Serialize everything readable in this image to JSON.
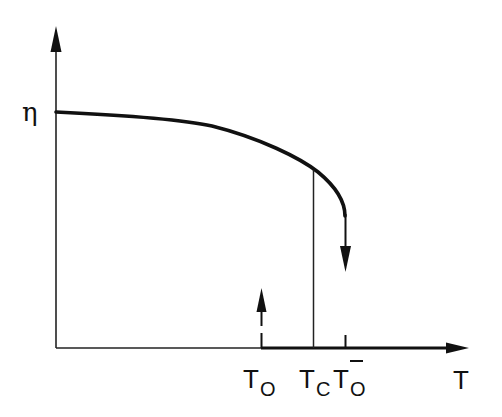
{
  "diagram": {
    "type": "order-parameter-vs-temperature",
    "y_axis": {
      "label": "η"
    },
    "x_axis": {
      "label": "T"
    },
    "markers": [
      {
        "id": "T0",
        "main": "T",
        "sub": "O",
        "overbar": false,
        "description": "upward dashed arrow from axis (supercooling limit)"
      },
      {
        "id": "Tc",
        "main": "T",
        "sub": "C",
        "overbar": false,
        "description": "vertical line from curve to axis (transition temperature)"
      },
      {
        "id": "T0bar",
        "main": "T",
        "sub": "O",
        "overbar": true,
        "description": "curve end with downward arrow (superheating limit)"
      }
    ],
    "curve": {
      "description": "η decreases slowly from constant value, steeper near Tc, ends at T0bar with downward jump arrow",
      "stroke": "#111111"
    },
    "colors": {
      "ink": "#111111",
      "background": "#ffffff"
    }
  }
}
